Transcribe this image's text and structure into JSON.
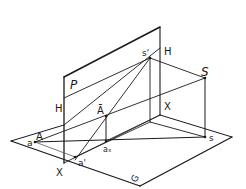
{
  "figure": {
    "stroke_color": "#1a1a1a",
    "background": "#ffffff"
  },
  "labels": {
    "picture_plane": "P",
    "ground_plane": "G",
    "horizon_left": "H",
    "horizon_right": "H",
    "ground_line_left": "X",
    "ground_line_right": "X",
    "station_point": "S",
    "station_point_ground": "s",
    "station_point_image": "s'",
    "point_A": "A",
    "point_a": "a",
    "point_A_bar": "Ā",
    "point_a_x": "aₓ",
    "point_a_prime": "a'"
  }
}
